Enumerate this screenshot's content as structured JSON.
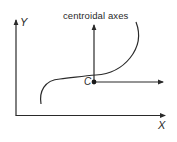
{
  "diagram": {
    "title": "centroidal axes",
    "axes": {
      "x_label": "X",
      "y_label": "Y"
    },
    "centroid": {
      "label": "C"
    },
    "colors": {
      "line": "#2a2a2a",
      "background": "#ffffff"
    },
    "elements": [
      {
        "type": "axis",
        "name": "global-x-axis",
        "label": "X"
      },
      {
        "type": "axis",
        "name": "global-y-axis",
        "label": "Y"
      },
      {
        "type": "curve",
        "name": "s-shaped-curve"
      },
      {
        "type": "point",
        "name": "centroid",
        "label": "C"
      },
      {
        "type": "axis",
        "name": "centroidal-x-axis"
      },
      {
        "type": "axis",
        "name": "centroidal-y-axis"
      }
    ]
  }
}
